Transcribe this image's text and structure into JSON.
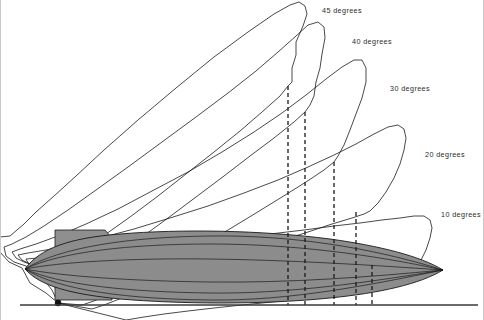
{
  "figure": {
    "background_color": "#ffffff",
    "line_color": "#1a1a1a",
    "hull_fill_color": "#8c8c8c",
    "shed_fill_color": "#8f8f8f",
    "ground_color": "#3a3a3a",
    "label_color": "#2b2b2b"
  },
  "labels": [
    {
      "id": "deg45",
      "text": "45  degrees",
      "x": 322,
      "y": 7
    },
    {
      "id": "deg40",
      "text": "40  degrees",
      "x": 352,
      "y": 38
    },
    {
      "id": "deg30",
      "text": "30  degrees",
      "x": 390,
      "y": 85
    },
    {
      "id": "deg20",
      "text": "20  degrees",
      "x": 425,
      "y": 151
    },
    {
      "id": "deg10",
      "text": "10  degrees",
      "x": 441,
      "y": 211
    }
  ],
  "arcs": [
    {
      "id": "arc-45",
      "degrees": 45,
      "outline": "M 58 303 L 46 293 L 30 283 L 22 268 L 9 262 L 0 252 L 0 237 L 10 236 L 24 224 L 36 212 L 54 196 L 76 176 L 104 150 L 138 120 L 176 88 L 214 57 L 248 32 L 274 14 L 290 5 L 299 2 L 305 6 L 307 14 L 303 26 L 296 42 L 296 55 L 292 68 L 292 82 L 288 86 L 280 96 L 262 112 L 240 131 L 214 152 L 186 174 L 158 196 L 130 217 L 106 234 L 86 248 L 72 260 L 62 272 L 57 284 Z"
    },
    {
      "id": "arc-40",
      "degrees": 40,
      "outline": "M 58 303 L 52 290 L 44 280 L 36 272 L 26 266 L 14 262 L 6 256 L 4 247 L 12 244 L 26 237 L 44 226 L 68 210 L 96 190 L 128 167 L 162 142 L 196 117 L 228 93 L 256 71 L 278 52 L 296 36 L 308 25 L 318 22 L 324 27 L 325 38 L 322 54 L 320 68 L 316 82 L 314 96 L 310 105 L 305 112 L 294 122 L 274 138 L 250 156 L 224 176 L 196 197 L 168 218 L 142 237 L 118 253 L 98 267 L 82 279 L 70 290 L 62 298 Z"
    },
    {
      "id": "arc-30",
      "degrees": 30,
      "outline": "M 58 303 L 56 290 L 52 280 L 46 272 L 36 266 L 24 262 L 16 258 L 12 252 L 20 249 L 36 244 L 58 236 L 86 224 L 118 209 L 152 191 L 188 172 L 222 152 L 254 132 L 282 113 L 306 95 L 326 79 L 342 67 L 354 60 L 362 60 L 366 68 L 366 82 L 362 98 L 356 114 L 350 130 L 344 145 L 338 156 L 334 162 L 324 170 L 306 182 L 282 197 L 256 213 L 228 230 L 200 246 L 174 261 L 150 274 L 128 285 L 110 294 L 94 301 L 82 305 Z"
    },
    {
      "id": "arc-20",
      "degrees": 20,
      "outline": "M 58 303 L 58 292 L 56 282 L 50 274 L 42 268 L 30 264 L 22 260 L 18 255 L 28 253 L 46 250 L 70 245 L 100 238 L 134 229 L 170 218 L 208 206 L 244 193 L 278 180 L 308 167 L 334 155 L 356 144 L 374 134 L 388 127 L 398 125 L 404 129 L 406 138 L 404 150 L 400 164 L 394 178 L 386 192 L 378 203 L 370 211 L 364 214 L 352 218 L 332 224 L 308 232 L 280 241 L 250 251 L 220 261 L 192 271 L 166 281 L 142 290 L 122 298 L 104 305 L 92 309 Z"
    },
    {
      "id": "arc-10",
      "degrees": 10,
      "outline": "M 58 303 L 60 294 L 60 285 L 56 277 L 48 271 L 36 267 L 28 263 L 26 259 L 38 258 L 58 256 L 84 254 L 116 251 L 152 247 L 192 243 L 232 238 L 270 234 L 304 230 L 334 226 L 360 223 L 382 220 L 400 218 L 414 216 L 424 216 L 430 220 L 432 228 L 430 238 L 426 250 L 420 262 L 412 272 L 404 280 L 396 285 L 388 288 L 374 290 L 354 293 L 330 296 L 302 299 L 272 302 L 242 305 L 214 308 L 188 311 L 164 314 L 144 317 L 126 320 Z"
    }
  ],
  "hull": {
    "id": "airship-hull",
    "nose_x": 25,
    "nose_y": 269,
    "tail_x": 443,
    "tail_y": 270,
    "outline": "M 25 269 C 40 248, 70 238, 120 234 C 180 229, 260 230, 330 239 C 380 246, 420 256, 443 270 C 420 284, 380 293, 330 298 C 260 305, 180 304, 120 299 C 70 294, 40 286, 25 269 Z",
    "longitudinal_lines": [
      "M 25 269 C 60 247, 130 237, 210 236 C 290 235, 370 247, 443 270",
      "M 25 269 C 60 252, 130 244, 210 244 C 290 244, 370 254, 443 270",
      "M 25 269 C 60 262, 130 258, 210 259 C 290 260, 370 265, 443 270",
      "M 25 269 C 60 276, 130 281, 210 282 C 290 283, 370 277, 443 270",
      "M 25 269 C 60 285, 130 292, 210 293 C 290 294, 370 282, 443 270",
      "M 25 269 C 60 291, 130 299, 210 300 C 290 301, 370 285, 443 270"
    ]
  },
  "shed": {
    "id": "mooring-shed",
    "outline": "M 55 230 L 105 230 L 112 238 L 112 300 L 55 300 Z"
  },
  "dashed_lines": [
    {
      "id": "dash-1",
      "x": 288,
      "y_top": 86,
      "y_bottom": 305
    },
    {
      "id": "dash-2",
      "x": 305,
      "y_top": 112,
      "y_bottom": 305
    },
    {
      "id": "dash-3",
      "x": 334,
      "y_top": 162,
      "y_bottom": 305
    },
    {
      "id": "dash-4",
      "x": 356,
      "y_top": 212,
      "y_bottom": 305
    },
    {
      "id": "dash-5",
      "x": 372,
      "y_top": 265,
      "y_bottom": 305
    }
  ],
  "ground": {
    "id": "ground-line",
    "x1": 20,
    "x2": 478,
    "y": 305
  },
  "pivot": {
    "id": "mooring-pivot",
    "x": 58,
    "y": 303
  }
}
